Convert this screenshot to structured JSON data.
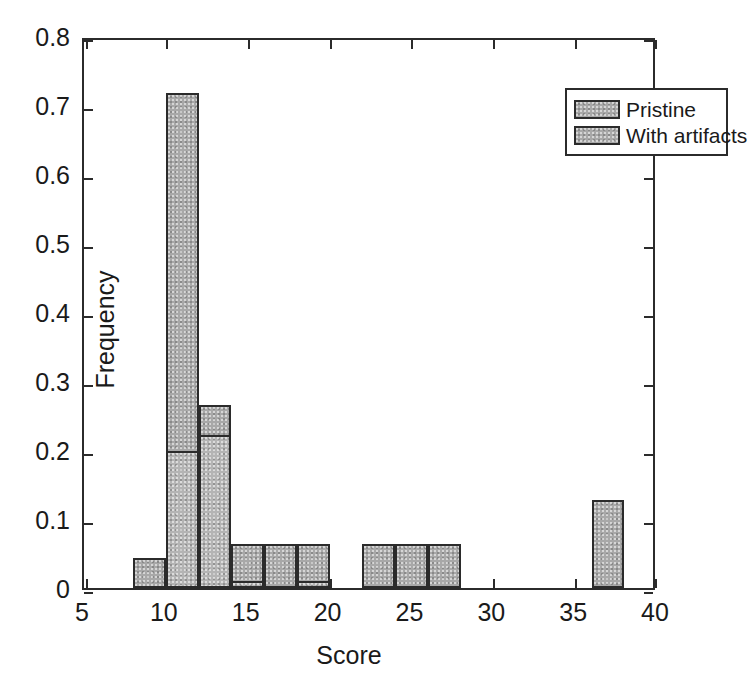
{
  "chart_data": {
    "type": "bar",
    "title": "",
    "subtitle": "",
    "xlabel": "Score",
    "ylabel": "Frequency",
    "xlim": [
      5,
      40
    ],
    "ylim": [
      0,
      0.8
    ],
    "grid": false,
    "bin_width": 2,
    "legend_position": "top-right",
    "xticks": [
      5,
      10,
      15,
      20,
      25,
      30,
      35,
      40
    ],
    "xtick_labels": [
      "5",
      "10",
      "15",
      "20",
      "25",
      "30",
      "35",
      "40"
    ],
    "yticks": [
      0,
      0.1,
      0.2,
      0.3,
      0.4,
      0.5,
      0.6,
      0.7,
      0.8
    ],
    "ytick_labels": [
      "0",
      "0.1",
      "0.2",
      "0.3",
      "0.4",
      "0.5",
      "0.6",
      "0.7",
      "0.8"
    ],
    "bin_edges": [
      8,
      10,
      12,
      14,
      16,
      18,
      20,
      22,
      24,
      26,
      28,
      30,
      32,
      34,
      36,
      38
    ],
    "bin_starts": [
      8,
      10,
      12,
      14,
      16,
      18,
      20,
      22,
      24,
      26,
      28,
      30,
      32,
      34,
      36
    ],
    "series": [
      {
        "name": "Pristine",
        "color": "#a8a8a8",
        "edge_color": "#2b2b2b",
        "values": [
          0.043,
          0.717,
          0.265,
          0.064,
          0.064,
          0.064,
          0.0,
          0.064,
          0.064,
          0.064,
          0.0,
          0.0,
          0.0,
          0.0,
          0.128
        ]
      },
      {
        "name": "With artifacts",
        "color": "#b4b4b4",
        "edge_color": "#2b2b2b",
        "values": [
          0.0,
          0.198,
          0.222,
          0.01,
          0.0,
          0.01,
          0.0,
          0.0,
          0.0,
          0.0,
          0.0,
          0.0,
          0.0,
          0.0,
          0.0
        ]
      }
    ]
  },
  "legend": {
    "entries": [
      {
        "label": "Pristine"
      },
      {
        "label": "With artifacts"
      }
    ]
  },
  "axes": {
    "x_title": "Score",
    "y_title": "Frequency"
  }
}
